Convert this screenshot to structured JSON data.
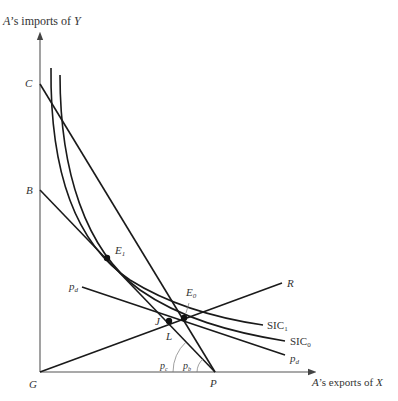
{
  "figure": {
    "y_axis_label": {
      "prefix": "A",
      "middle": "’s imports of ",
      "var": "Y"
    },
    "x_axis_label": {
      "prefix": "A",
      "middle": "’s exports of ",
      "var": "X"
    },
    "origin_label": "G",
    "intercepts": {
      "C": "C",
      "B": "B",
      "P": "P"
    },
    "curves": [
      {
        "id": "SIC1",
        "base": "SIC",
        "sub": "1"
      },
      {
        "id": "SIC0",
        "base": "SIC",
        "sub": "0"
      }
    ],
    "lines": {
      "ray_R": "R",
      "price_d": {
        "base": "p",
        "sub": "d"
      },
      "price_c": {
        "base": "p",
        "sub": "c"
      },
      "price_b": {
        "base": "p",
        "sub": "b"
      }
    },
    "points": {
      "E1": {
        "base": "E",
        "sub": "1"
      },
      "E0": {
        "base": "E",
        "sub": "0"
      },
      "J": "J",
      "L": "L"
    }
  }
}
